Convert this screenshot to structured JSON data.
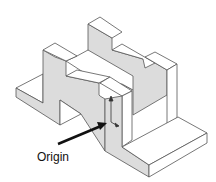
{
  "diagram": {
    "annotation": {
      "label": "Origin"
    },
    "colors": {
      "line": "#555555",
      "face_shaded": "#dcdcdc",
      "face_light": "#ffffff",
      "arrow": "#111111"
    }
  }
}
